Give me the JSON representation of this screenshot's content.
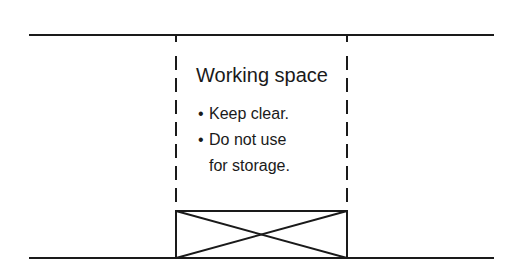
{
  "diagram": {
    "title": "Working space",
    "bullet_glyph": "•",
    "bullets": [
      "Keep clear.",
      "Do not use"
    ],
    "continuation": "for storage.",
    "colors": {
      "line": "#1a1a1a",
      "background": "#ffffff"
    }
  }
}
